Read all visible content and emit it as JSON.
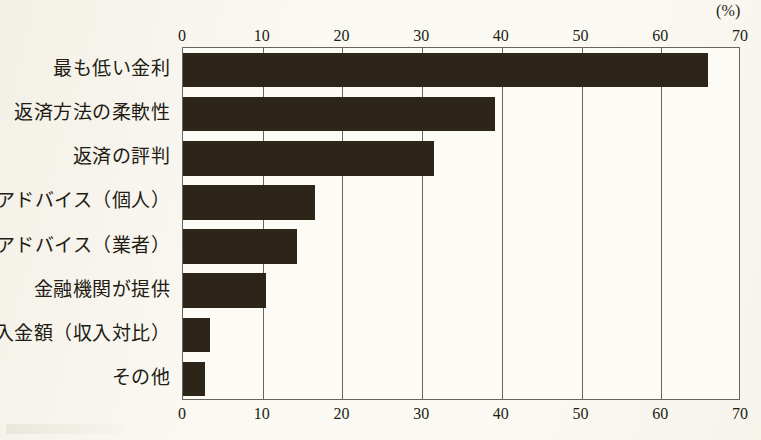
{
  "chart_data": {
    "type": "bar",
    "orientation": "horizontal",
    "title": "",
    "subtitle": "",
    "xlabel": "",
    "ylabel": "",
    "unit_label": "(%)",
    "xlim": [
      0,
      70
    ],
    "ylim": null,
    "grid": true,
    "grid_axis": "x",
    "legend": null,
    "legend_position": "none",
    "axis_top": true,
    "axis_bottom": true,
    "categories": [
      "最も低い金利",
      "返済方法の柔軟性",
      "返済の評判",
      "アドバイス（個人）",
      "アドバイス（業者）",
      "金融機関が提供",
      "借入金額（収入対比）",
      "その他"
    ],
    "values": [
      65.9,
      39.2,
      31.5,
      16.5,
      14.3,
      10.4,
      3.4,
      2.8
    ],
    "tick_values": [
      0,
      10,
      20,
      30,
      40,
      50,
      60,
      70
    ],
    "tick_labels": [
      "0",
      "10",
      "20",
      "30",
      "40",
      "50",
      "60",
      "70"
    ],
    "bar_color": "#2e2519",
    "background_color": "#fbf9f3",
    "frame_color": "#6a645b",
    "text_color": "#221c14"
  }
}
